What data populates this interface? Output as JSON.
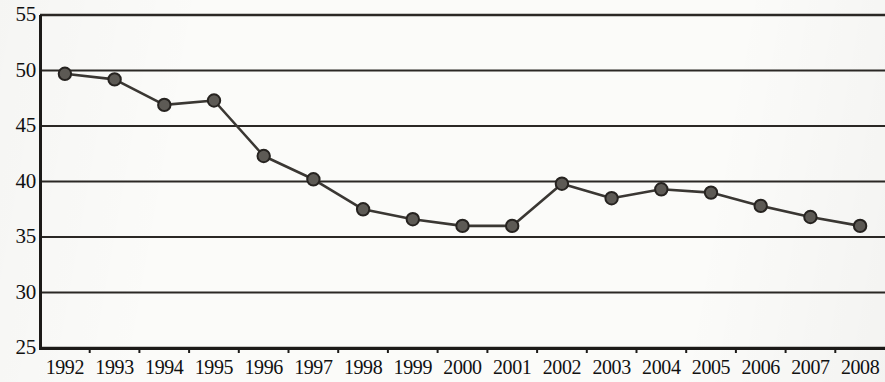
{
  "chart_data": {
    "type": "line",
    "title": "",
    "subtitle": "",
    "xlabel": "",
    "ylabel": "",
    "categories": [
      "1992",
      "1993",
      "1994",
      "1995",
      "1996",
      "1997",
      "1998",
      "1999",
      "2000",
      "2001",
      "2002",
      "2003",
      "2004",
      "2005",
      "2006",
      "2007",
      "2008"
    ],
    "values": [
      49.7,
      49.2,
      46.9,
      47.3,
      42.3,
      40.2,
      37.5,
      36.6,
      36.0,
      36.0,
      39.8,
      38.5,
      39.3,
      39.0,
      37.8,
      36.8,
      36.0
    ],
    "series": [
      {
        "name": "",
        "values": [
          49.7,
          49.2,
          46.9,
          47.3,
          42.3,
          40.2,
          37.5,
          36.6,
          36.0,
          36.0,
          39.8,
          38.5,
          39.3,
          39.0,
          37.8,
          36.8,
          36.0
        ]
      }
    ],
    "ylim": [
      25,
      55
    ],
    "yticks": [
      25,
      30,
      35,
      40,
      45,
      50,
      55
    ],
    "ytick_labels": [
      "25",
      "30",
      "35",
      "40",
      "45",
      "50",
      "55"
    ],
    "xtick_labels": [
      "1992",
      "1993",
      "1994",
      "1995",
      "1996",
      "1997",
      "1998",
      "1999",
      "2000",
      "2001",
      "2002",
      "2003",
      "2004",
      "2005",
      "2006",
      "2007",
      "2008"
    ],
    "grid": true,
    "grid_axis": "y",
    "legend": false,
    "legend_position": "none",
    "annotations": [],
    "marker": "circle",
    "colors": {
      "line": "#3a3733",
      "marker_fill": "#5d5a55",
      "marker_stroke": "#262320",
      "grid": "#2b2825",
      "axis": "#1c1a18",
      "text": "#111111",
      "background": "#fbfbf9"
    }
  }
}
